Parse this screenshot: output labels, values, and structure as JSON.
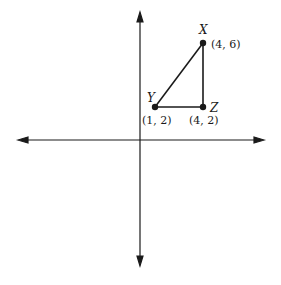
{
  "diagram": {
    "type": "coordinate-plane-triangle",
    "points": [
      {
        "name": "X",
        "coord_label": "(4, 6)",
        "x": 4,
        "y": 6
      },
      {
        "name": "Y",
        "coord_label": "(1, 2)",
        "x": 1,
        "y": 2
      },
      {
        "name": "Z",
        "coord_label": "(4, 2)",
        "x": 4,
        "y": 2
      }
    ],
    "segments": [
      "XY",
      "YZ",
      "ZX"
    ],
    "colors": {
      "ink": "#1a1a1a",
      "background": "#ffffff"
    }
  }
}
